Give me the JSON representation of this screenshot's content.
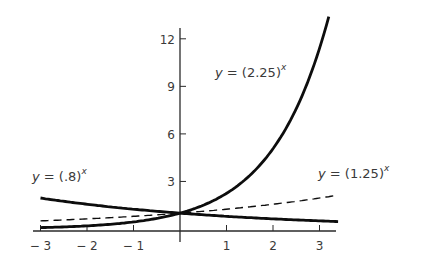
{
  "chart_data": {
    "type": "line",
    "title": "",
    "xlabel": "",
    "ylabel": "",
    "xlim": [
      -3,
      3.3
    ],
    "ylim": [
      0,
      13
    ],
    "grid": false,
    "legend": "none (inline curve labels)",
    "x_ticks": [
      -3,
      -2,
      -1,
      1,
      2,
      3
    ],
    "x_tick_labels": [
      "− 3",
      "− 2",
      "− 1",
      "1",
      "2",
      "3"
    ],
    "y_ticks": [
      3,
      6,
      9,
      12
    ],
    "y_tick_labels": [
      "3",
      "6",
      "9",
      "12"
    ],
    "series": [
      {
        "name": "y = (2.25)^x",
        "base": 2.25,
        "style": "solid-thick",
        "x": [
          -3,
          -2,
          -1,
          0,
          1,
          2,
          3,
          3.2
        ],
        "values": [
          0.09,
          0.2,
          0.44,
          1,
          2.25,
          5.06,
          11.39,
          13.4
        ],
        "label": {
          "prefix": "y = (2.25)",
          "exp": "x"
        }
      },
      {
        "name": "y = (1.25)^x",
        "base": 1.25,
        "style": "dashed",
        "x": [
          -3,
          -2,
          -1,
          0,
          1,
          2,
          3,
          3.3
        ],
        "values": [
          0.51,
          0.64,
          0.8,
          1,
          1.25,
          1.56,
          1.95,
          2.09
        ],
        "label": {
          "prefix": "y = (1.25)",
          "exp": "x"
        }
      },
      {
        "name": "y = (.8)^x",
        "base": 0.8,
        "style": "solid-thick",
        "x": [
          -3,
          -2,
          -1,
          0,
          1,
          2,
          3,
          3.4
        ],
        "values": [
          1.95,
          1.56,
          1.25,
          1,
          0.8,
          0.64,
          0.51,
          0.47
        ],
        "label": {
          "prefix": "y = (.8)",
          "exp": "x"
        }
      }
    ]
  },
  "colors": {
    "curve": "#0d0d0d",
    "axis": "#2a2a2a",
    "text": "#3a3a3a",
    "background": "#ffffff"
  }
}
